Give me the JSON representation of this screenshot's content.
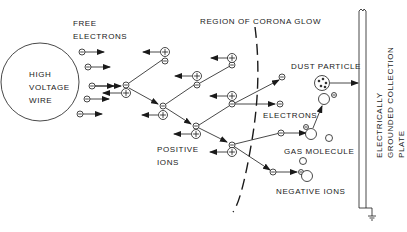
{
  "labels": {
    "free_electrons": [
      "FREE",
      "ELECTRONS"
    ],
    "wire": [
      "HIGH",
      "VOLTAGE",
      "WIRE"
    ],
    "corona": "REGION OF CORONA GLOW",
    "positive_ions": [
      "POSITIVE",
      "IONS"
    ],
    "electrons": "ELECTRONS",
    "dust_particle": "DUST PARTICLE",
    "gas_molecule": "GAS MOLECULE",
    "negative_ions": "NEGATIVE IONS",
    "plate": [
      "ELECTRICALLY",
      "GROUNDED COLLECTION",
      "PLATE"
    ]
  },
  "symbols": {
    "negative": "−",
    "positive": "+"
  },
  "colors": {
    "ink": "#1a1a1a",
    "background": "#ffffff"
  }
}
